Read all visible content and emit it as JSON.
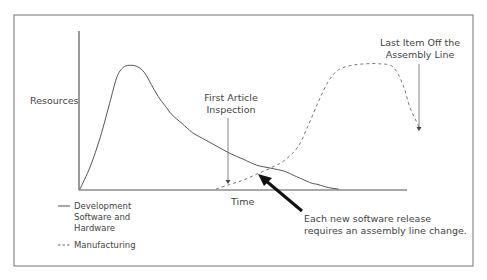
{
  "chart_data": {
    "type": "line",
    "title": "",
    "xlabel": "Time",
    "ylabel": "Resources",
    "grid": false,
    "legend_position": "bottom-left",
    "x_range": [
      0,
      100
    ],
    "y_range": [
      0,
      100
    ],
    "series": [
      {
        "name": "Development Software and Hardware",
        "legend_lines": [
          "Development",
          "Software and",
          "Hardware"
        ],
        "style": "solid",
        "color": "#555555",
        "x": [
          0,
          3,
          6,
          9,
          11,
          13,
          15,
          17,
          19,
          21,
          23,
          25,
          27,
          30,
          33,
          36,
          40,
          44,
          48,
          52,
          56,
          60,
          63,
          66,
          68,
          70,
          73,
          76
        ],
        "y": [
          0,
          15,
          35,
          60,
          76,
          82,
          83,
          82,
          78,
          70,
          62,
          56,
          50,
          44,
          38,
          34,
          29,
          24,
          20,
          16,
          14,
          12,
          9,
          6,
          4,
          3,
          1,
          0
        ]
      },
      {
        "name": "Manufacturing",
        "legend_lines": [
          "Manufacturing"
        ],
        "style": "dashed",
        "color": "#777777",
        "x": [
          40,
          44,
          48,
          52,
          56,
          60,
          64,
          67,
          70,
          73,
          76,
          80,
          84,
          88,
          92,
          95,
          97,
          99,
          100
        ],
        "y": [
          0,
          3,
          6,
          10,
          14,
          19,
          28,
          42,
          58,
          72,
          80,
          83,
          84,
          84,
          82,
          70,
          55,
          45,
          40
        ]
      }
    ],
    "annotations": [
      {
        "id": "first-article",
        "lines": [
          "First Article",
          "Inspection"
        ],
        "x": 46,
        "target_y": 2
      },
      {
        "id": "last-item",
        "lines": [
          "Last Item Off the",
          "Assembly Line"
        ],
        "x": 100,
        "target_y": 42
      },
      {
        "id": "software-release",
        "lines": [
          "Each new software release",
          "requires an assembly line change."
        ],
        "x": 56,
        "target_y": 14,
        "bold_arrow": true
      }
    ]
  }
}
